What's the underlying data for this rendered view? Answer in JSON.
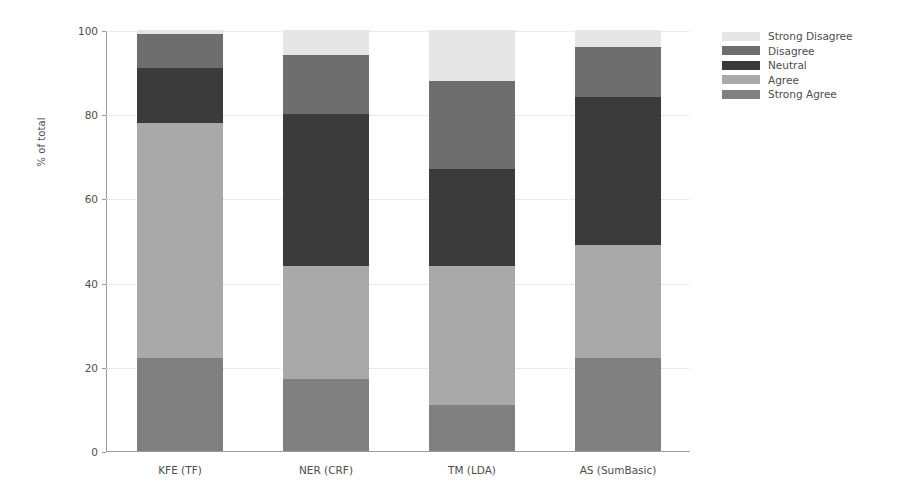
{
  "chart_data": {
    "type": "bar",
    "stacked": true,
    "orientation": "vertical",
    "title": "",
    "xlabel": "",
    "ylabel": "% of total",
    "ylim": [
      0,
      100
    ],
    "yticks": [
      0,
      20,
      40,
      60,
      80,
      100
    ],
    "ytick_labels": [
      "0",
      "20",
      "40",
      "60",
      "80",
      "100"
    ],
    "grid": true,
    "grid_axis": "y",
    "legend_position": "right",
    "categories": [
      "KFE (TF)",
      "NER (CRF)",
      "TM (LDA)",
      "AS (SumBasic)"
    ],
    "series": [
      {
        "name": "Strong Agree",
        "color": "#808080",
        "values": [
          22,
          17,
          11,
          22
        ]
      },
      {
        "name": "Agree",
        "color": "#a9a9a9",
        "values": [
          56,
          27,
          33,
          27
        ]
      },
      {
        "name": "Neutral",
        "color": "#3b3b3b",
        "values": [
          13,
          36,
          23,
          35
        ]
      },
      {
        "name": "Disagree",
        "color": "#6e6e6e",
        "values": [
          8,
          14,
          21,
          12
        ]
      },
      {
        "name": "Strong Disagree",
        "color": "#e6e6e6",
        "values": [
          1,
          6,
          12,
          4
        ]
      }
    ],
    "legend_order": [
      "Strong Disagree",
      "Disagree",
      "Neutral",
      "Agree",
      "Strong Agree"
    ]
  },
  "axes": {
    "y_title": "% of total"
  },
  "legend": {
    "items": [
      {
        "label": "Strong Disagree",
        "color": "#e6e6e6"
      },
      {
        "label": "Disagree",
        "color": "#6e6e6e"
      },
      {
        "label": "Neutral",
        "color": "#3b3b3b"
      },
      {
        "label": "Agree",
        "color": "#a9a9a9"
      },
      {
        "label": "Strong Agree",
        "color": "#808080"
      }
    ]
  }
}
